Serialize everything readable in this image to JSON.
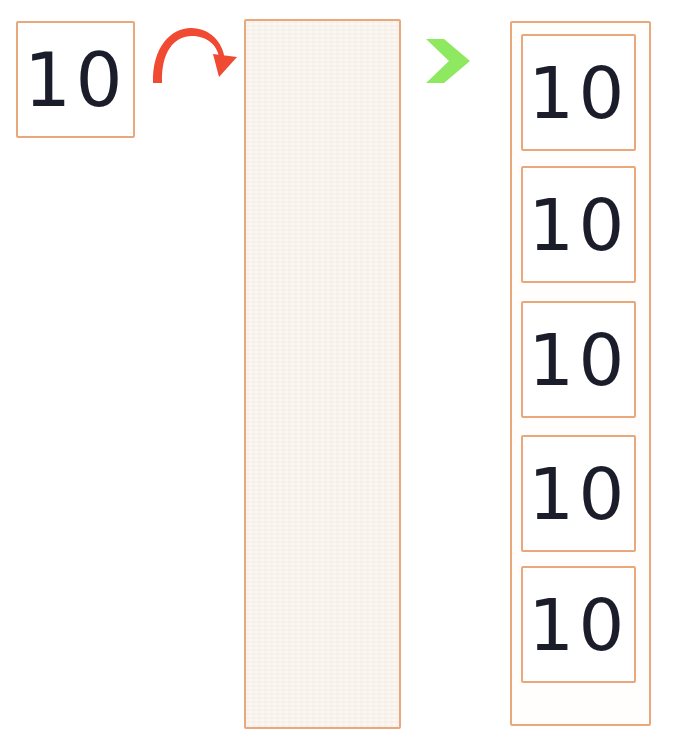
{
  "diagram": {
    "colors": {
      "box_border": "#e8a87c",
      "numeral": "#1b1d2b",
      "repeat_arrow": "#f04a32",
      "flow_arrow": "#8ee860",
      "paper_fill": "#faf6f1",
      "background": "#ffffff"
    },
    "source": {
      "label": "10",
      "name": "source-value-card"
    },
    "repeat_arrow": {
      "icon": "curved-repeat-arrow-icon",
      "direction": "clockwise-over",
      "color": "#f04a32"
    },
    "empty_panel": {
      "label": "",
      "name": "empty-paper-panel",
      "fill": "#faf6f1"
    },
    "flow_arrow": {
      "icon": "chevron-right-arrow-icon",
      "direction": "right",
      "color": "#8ee860"
    },
    "result": {
      "name": "repeated-values-column",
      "count": 5,
      "cards": [
        {
          "label": "10"
        },
        {
          "label": "10"
        },
        {
          "label": "10"
        },
        {
          "label": "10"
        },
        {
          "label": "10"
        }
      ]
    }
  }
}
